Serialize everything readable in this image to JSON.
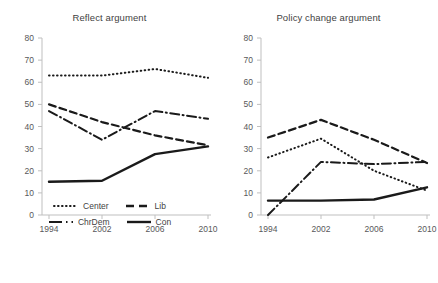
{
  "chart_data": [
    {
      "type": "line",
      "title": "Reflect argument",
      "xlabel": "",
      "ylabel": "",
      "categories": [
        "1994",
        "2002",
        "2006",
        "2010"
      ],
      "ylim": [
        0,
        80
      ],
      "ytick_step": 10,
      "yticks": [
        "0",
        "10",
        "20",
        "30",
        "40",
        "50",
        "60",
        "70",
        "80"
      ],
      "grid": false,
      "legend_position": "bottom",
      "series": [
        {
          "name": "Center",
          "style": "dotted",
          "values": [
            63,
            63,
            66,
            62
          ]
        },
        {
          "name": "Lib",
          "style": "dashed",
          "values": [
            50,
            42,
            36,
            31.5
          ]
        },
        {
          "name": "ChrDem",
          "style": "dashdot",
          "values": [
            47,
            34,
            47,
            43.5
          ]
        },
        {
          "name": "Con",
          "style": "solid",
          "values": [
            15,
            15.5,
            27.5,
            31
          ]
        }
      ]
    },
    {
      "type": "line",
      "title": "Policy change argument",
      "xlabel": "",
      "ylabel": "",
      "categories": [
        "1994",
        "2002",
        "2006",
        "2010"
      ],
      "ylim": [
        0,
        80
      ],
      "ytick_step": 10,
      "yticks": [
        "0",
        "10",
        "20",
        "30",
        "40",
        "50",
        "60",
        "70",
        "80"
      ],
      "grid": false,
      "legend_position": "bottom",
      "series": [
        {
          "name": "Center",
          "style": "dotted",
          "values": [
            26,
            34.5,
            20,
            11
          ]
        },
        {
          "name": "Lib",
          "style": "dashed",
          "values": [
            35,
            43,
            34,
            23.5
          ]
        },
        {
          "name": "ChrDem",
          "style": "dashdot",
          "values": [
            0,
            24,
            23,
            24
          ]
        },
        {
          "name": "Con",
          "style": "solid",
          "values": [
            6.5,
            6.5,
            7,
            12.5
          ]
        }
      ]
    }
  ],
  "panels": {
    "left": {
      "title": "Reflect argument",
      "yticks": [
        "80",
        "70",
        "60",
        "50",
        "40",
        "30",
        "20",
        "10",
        "0"
      ],
      "xticks": [
        "1994",
        "2002",
        "2006",
        "2010"
      ]
    },
    "right": {
      "title": "Policy change argument",
      "yticks": [
        "80",
        "70",
        "60",
        "50",
        "40",
        "30",
        "20",
        "10",
        "0"
      ],
      "xticks": [
        "1994",
        "2002",
        "2006",
        "2010"
      ]
    }
  },
  "legend": {
    "center_label": "Center",
    "lib_label": "Lib",
    "chrdem_label": "ChrDem",
    "con_label": "Con"
  },
  "colors": {
    "line": "#1a1a1a",
    "axis": "#bfbfbf",
    "tick_text": "#58585a",
    "title_text": "#3f3f3f",
    "background": "#ffffff"
  }
}
